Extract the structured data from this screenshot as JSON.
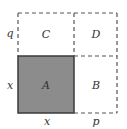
{
  "diagram": {
    "colors": {
      "shaded_fill": "#8c8c8c",
      "solid_border": "#3a3a3a",
      "dashed_line": "#555555",
      "label": "#333333"
    },
    "regions": {
      "A": "A",
      "B": "B",
      "C": "C",
      "D": "D"
    },
    "side_labels": {
      "left_top": "q",
      "left_bottom": "x",
      "bottom_left": "x",
      "bottom_right": "p"
    }
  }
}
